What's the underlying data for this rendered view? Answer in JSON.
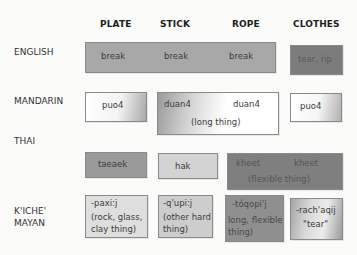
{
  "columns": [
    "PLATE",
    "STICK",
    "ROPE",
    "CLOTHES"
  ],
  "rows": [
    {
      "language": "ENGLISH",
      "cells": [
        {
          "id": "english-break",
          "spans": [
            "PLATE",
            "STICK",
            "ROPE"
          ],
          "words": [
            "break",
            "break",
            "break"
          ],
          "note": "",
          "fill": "#a9a9a9"
        },
        {
          "id": "english-tear",
          "spans": [
            "CLOTHES"
          ],
          "words": [
            "tear, rip"
          ],
          "note": "",
          "fill": "#7d7d7d"
        }
      ]
    },
    {
      "language": "MANDARIN",
      "cells": [
        {
          "id": "mandarin-puo4-plate",
          "spans": [
            "PLATE"
          ],
          "words": [
            "puo4"
          ],
          "note": "",
          "fill": "gradient-white-gray"
        },
        {
          "id": "mandarin-duan4",
          "spans": [
            "STICK",
            "ROPE"
          ],
          "words": [
            "duan4",
            "duan4"
          ],
          "note": "(long thing)",
          "fill": "gradient-gray-white"
        },
        {
          "id": "mandarin-puo4-clothes",
          "spans": [
            "CLOTHES"
          ],
          "words": [
            "puo4"
          ],
          "note": "",
          "fill": "gradient-white-gray"
        }
      ]
    },
    {
      "language": "THAI",
      "cells": [
        {
          "id": "thai-taeaek",
          "spans": [
            "PLATE"
          ],
          "words": [
            "taeaek"
          ],
          "note": "",
          "fill": "#999999"
        },
        {
          "id": "thai-hak",
          "spans": [
            "STICK"
          ],
          "words": [
            "hak"
          ],
          "note": "",
          "fill": "#d4d4d4"
        },
        {
          "id": "thai-kheet",
          "spans": [
            "ROPE",
            "CLOTHES"
          ],
          "words": [
            "kheet",
            "kheet"
          ],
          "note": "(flexible thing)",
          "fill": "#7e7e7e"
        }
      ]
    },
    {
      "language_lines": [
        "K'ICHE'",
        "MAYAN"
      ],
      "cells": [
        {
          "id": "kiche-paxij",
          "spans": [
            "PLATE"
          ],
          "words": [
            "-paxi:j"
          ],
          "note": "(rock, glass, clay thing)",
          "fill": "#dcdcdc"
        },
        {
          "id": "kiche-qupij",
          "spans": [
            "STICK"
          ],
          "words": [
            "-q'upi:j"
          ],
          "note": "(other hard thing)",
          "fill": "#cfcfcf"
        },
        {
          "id": "kiche-toqopij",
          "spans": [
            "ROPE"
          ],
          "words": [
            "-tóqopi'j"
          ],
          "note": "long, flexible thing)",
          "fill": "#8e8e8e"
        },
        {
          "id": "kiche-rachaqij",
          "spans": [
            "CLOTHES"
          ],
          "words": [
            "-rach'aqij"
          ],
          "note": "\"tear\"",
          "fill": "gradient-gray-light"
        }
      ]
    }
  ],
  "text": {
    "col_plate": "PLATE",
    "col_stick": "STICK",
    "col_rope": "ROPE",
    "col_clothes": "CLOTHES",
    "row_english": "ENGLISH",
    "row_mandarin": "MANDARIN",
    "row_thai": "THAI",
    "row_kiche_1": "K'ICHE'",
    "row_kiche_2": "MAYAN",
    "en_break_1": "break",
    "en_break_2": "break",
    "en_break_3": "break",
    "en_tear": "tear, rip",
    "zh_puo4_a": "puo4",
    "zh_duan4_a": "duan4",
    "zh_duan4_b": "duan4",
    "zh_duan4_note": "(long thing)",
    "zh_puo4_b": "puo4",
    "th_taeaek": "taeaek",
    "th_hak": "hak",
    "th_kheet_a": "kheet",
    "th_kheet_b": "kheet",
    "th_kheet_note": "(flexible thing)",
    "kq_paxij": "-paxi:j",
    "kq_paxij_note": "(rock, glass, clay thing)",
    "kq_qupij": "-q'upi:j",
    "kq_qupij_note": "(other hard thing)",
    "kq_toqopij": "-tóqopi'j",
    "kq_toqopij_note": "long, flexible thing)",
    "kq_rachaqij": "-rach'aqij",
    "kq_rachaqij_note": "\"tear\""
  }
}
